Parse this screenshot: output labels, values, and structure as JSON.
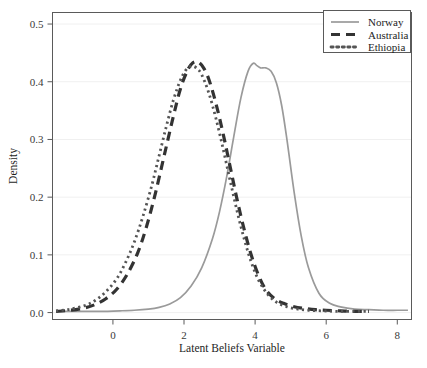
{
  "chart_data": {
    "type": "line",
    "title": "",
    "xlabel": "Latent Beliefs Variable",
    "ylabel": "Density",
    "xlim": [
      -1.7,
      8.4
    ],
    "ylim": [
      -0.012,
      0.52
    ],
    "xticks": [
      0,
      2,
      4,
      6,
      8
    ],
    "xtick_labels": [
      "0",
      "2",
      "4",
      "6",
      "8"
    ],
    "yticks": [
      0.0,
      0.1,
      0.2,
      0.3,
      0.4,
      0.5
    ],
    "ytick_labels": [
      "0.0",
      "0.1",
      "0.2",
      "0.3",
      "0.4",
      "0.5"
    ],
    "grid": true,
    "legend_position": "top-right",
    "series": [
      {
        "name": "Norway",
        "style": "solid",
        "color": "#9a9a9a",
        "x": [
          -1.6,
          -1.0,
          -0.4,
          0.2,
          0.6,
          1.0,
          1.3,
          1.6,
          1.9,
          2.2,
          2.5,
          2.8,
          3.0,
          3.2,
          3.4,
          3.6,
          3.8,
          3.95,
          4.05,
          4.15,
          4.3,
          4.45,
          4.6,
          4.75,
          4.9,
          5.1,
          5.3,
          5.5,
          5.8,
          6.1,
          6.4,
          6.8,
          7.2,
          7.6,
          8.0,
          8.3
        ],
        "y": [
          0.002,
          0.002,
          0.002,
          0.003,
          0.004,
          0.006,
          0.009,
          0.015,
          0.026,
          0.046,
          0.078,
          0.128,
          0.175,
          0.235,
          0.305,
          0.372,
          0.418,
          0.432,
          0.428,
          0.424,
          0.424,
          0.418,
          0.398,
          0.358,
          0.298,
          0.208,
          0.132,
          0.078,
          0.033,
          0.016,
          0.01,
          0.006,
          0.005,
          0.004,
          0.004,
          0.004
        ]
      },
      {
        "name": "Australia",
        "style": "dashed",
        "color": "#333333",
        "x": [
          -1.6,
          -1.2,
          -0.8,
          -0.5,
          -0.2,
          0.1,
          0.4,
          0.7,
          0.95,
          1.2,
          1.45,
          1.7,
          1.9,
          2.1,
          2.25,
          2.4,
          2.55,
          2.7,
          2.9,
          3.1,
          3.3,
          3.5,
          3.7,
          3.9,
          4.1,
          4.3,
          4.55,
          4.8,
          5.1,
          5.4,
          5.7,
          6.0,
          6.4,
          6.8,
          7.2
        ],
        "y": [
          0.002,
          0.004,
          0.008,
          0.014,
          0.024,
          0.04,
          0.066,
          0.104,
          0.15,
          0.208,
          0.274,
          0.34,
          0.388,
          0.42,
          0.433,
          0.434,
          0.424,
          0.404,
          0.362,
          0.31,
          0.252,
          0.194,
          0.142,
          0.098,
          0.064,
          0.04,
          0.024,
          0.016,
          0.01,
          0.007,
          0.005,
          0.004,
          0.003,
          0.002,
          0.002
        ]
      },
      {
        "name": "Ethiopia",
        "style": "dotted",
        "color": "#555555",
        "x": [
          -1.6,
          -1.2,
          -0.8,
          -0.5,
          -0.2,
          0.1,
          0.35,
          0.6,
          0.85,
          1.1,
          1.3,
          1.5,
          1.7,
          1.9,
          2.05,
          2.2,
          2.35,
          2.5,
          2.7,
          2.9,
          3.1,
          3.3,
          3.5,
          3.7,
          3.9,
          4.1,
          4.35,
          4.6,
          4.9,
          5.2,
          5.5,
          5.9,
          6.3,
          6.8,
          7.2
        ],
        "y": [
          0.003,
          0.006,
          0.012,
          0.021,
          0.036,
          0.058,
          0.086,
          0.122,
          0.168,
          0.222,
          0.272,
          0.322,
          0.368,
          0.403,
          0.42,
          0.427,
          0.424,
          0.412,
          0.38,
          0.336,
          0.284,
          0.228,
          0.174,
          0.126,
          0.086,
          0.056,
          0.032,
          0.018,
          0.01,
          0.006,
          0.004,
          0.003,
          0.002,
          0.002,
          0.002
        ]
      }
    ]
  },
  "legend": {
    "entries": [
      {
        "label": "Norway"
      },
      {
        "label": "Australia"
      },
      {
        "label": "Ethiopia"
      }
    ]
  },
  "axes": {
    "x_title": "Latent Beliefs Variable",
    "y_title": "Density"
  }
}
